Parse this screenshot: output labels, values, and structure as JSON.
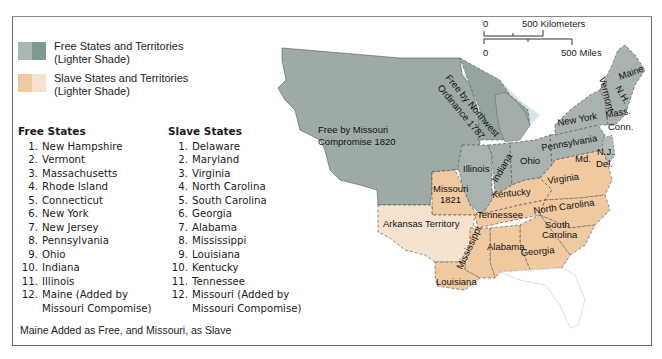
{
  "legend": {
    "free": {
      "label_line1": "Free States and Territories",
      "label_line2": "(Lighter Shade)",
      "colors": [
        "#a9b8b3",
        "#7d9a92"
      ]
    },
    "slave": {
      "label_line1": "Slave States and Territories",
      "label_line2": "(Lighter Shade)",
      "colors": [
        "#f0c9a0",
        "#f6e3cf"
      ]
    }
  },
  "free_states": {
    "title": "Free States",
    "items": [
      {
        "num": "1.",
        "name": "New Hampshire"
      },
      {
        "num": "2.",
        "name": "Vermont"
      },
      {
        "num": "3.",
        "name": "Massachusetts"
      },
      {
        "num": "4.",
        "name": "Rhode Island"
      },
      {
        "num": "5.",
        "name": "Connecticut"
      },
      {
        "num": "6.",
        "name": "New York"
      },
      {
        "num": "7.",
        "name": "New Jersey"
      },
      {
        "num": "8.",
        "name": "Pennsylvania"
      },
      {
        "num": "9.",
        "name": "Ohio"
      },
      {
        "num": "10.",
        "name": "Indiana"
      },
      {
        "num": "11.",
        "name": "Illinois"
      },
      {
        "num": "12.",
        "name": "Maine (Added by",
        "cont": "Missouri Compomise)"
      }
    ]
  },
  "slave_states": {
    "title": "Slave States",
    "items": [
      {
        "num": "1.",
        "name": "Delaware"
      },
      {
        "num": "2.",
        "name": "Maryland"
      },
      {
        "num": "3.",
        "name": "Virginia"
      },
      {
        "num": "4.",
        "name": "North Carolina"
      },
      {
        "num": "5.",
        "name": "South Carolina"
      },
      {
        "num": "6.",
        "name": "Georgia"
      },
      {
        "num": "7.",
        "name": "Alabama"
      },
      {
        "num": "8.",
        "name": "Mississippi"
      },
      {
        "num": "9.",
        "name": "Louisiana"
      },
      {
        "num": "10.",
        "name": "Kentucky"
      },
      {
        "num": "11.",
        "name": "Tennessee"
      },
      {
        "num": "12.",
        "name": "Missouri (Added by",
        "cont": "Missouri Compomise)"
      }
    ]
  },
  "footnote": "Maine Added as Free, and Missouri, as Slave",
  "scale": {
    "km_zero": "0",
    "km_label": "500 Kilometers",
    "mi_zero": "0",
    "mi_label": "500 Miles"
  },
  "map_labels": {
    "missouri_compromise_line1": "Free by Missouri",
    "missouri_compromise_line2": "Compromise 1820",
    "northwest_line1": "Free by Northwest",
    "northwest_line2": "Ordinance 1787",
    "illinois": "Illinois",
    "indiana": "Indiana",
    "ohio": "Ohio",
    "pennsylvania": "Pennsylvania",
    "new_york": "New York",
    "vermont": "Vermont",
    "nh": "N.H.",
    "maine": "Maine",
    "mass": "Mass.",
    "conn": "Conn.",
    "nj": "N.J.",
    "del": "Del.",
    "md": "Md.",
    "virginia": "Virginia",
    "kentucky": "Kentucky",
    "missouri_line1": "Missouri",
    "missouri_line2": "1821",
    "arkansas": "Arkansas Territory",
    "tennessee": "Tennessee",
    "north_carolina": "North Carolina",
    "south_carolina_line1": "South",
    "south_carolina_line2": "Carolina",
    "mississippi": "Mississippi",
    "alabama": "Alabama",
    "georgia": "Georgia",
    "louisiana": "Louisiana"
  }
}
